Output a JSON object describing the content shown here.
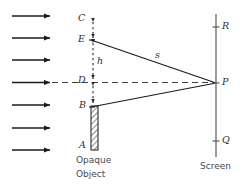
{
  "figure": {
    "type": "optics-diffraction-schematic",
    "colors": {
      "ray": "#1a1a1a",
      "dashed": "#3d3d3d",
      "screen": "#6e6e6e",
      "hatch": "#2b2b2b",
      "text": "#3a3a3a"
    }
  },
  "points": {
    "C": "C",
    "E": "E",
    "D": "D",
    "B": "B",
    "A": "A",
    "P": "P",
    "R": "R",
    "Q": "Q"
  },
  "annotations": {
    "h": "h",
    "s": "s"
  },
  "captions": {
    "object_line1": "Opaque",
    "object_line2": "Object",
    "screen": "Screen"
  },
  "geometry": {
    "incoming_rays_count": 7,
    "incoming_rays_y": [
      16,
      38,
      60,
      82.5,
      105,
      128,
      150
    ],
    "incoming_ray_x_start": 12,
    "incoming_ray_x_end": 52,
    "edge_x": 93,
    "screen_x": 216,
    "axis_y": 83,
    "C_y": 20,
    "E_y": 40,
    "D_y": 82,
    "B_y": 106,
    "A_y": 146,
    "P_y": 83,
    "R_y": 27,
    "Q_y": 141,
    "bar_top": 106,
    "bar_bottom": 150,
    "bar_left": 91,
    "bar_right": 98
  }
}
